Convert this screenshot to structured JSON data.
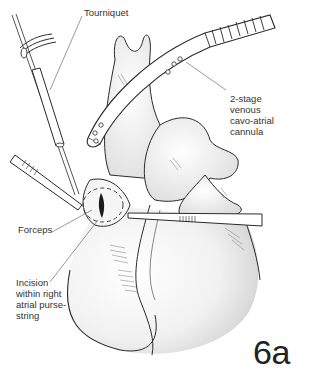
{
  "figure": {
    "number": "6a",
    "labels": {
      "tourniquet": "Tourniquet",
      "cannula": "2-stage\nvenous\ncavo-atrial\ncannula",
      "forceps": "Forceps",
      "incision": "Incision\nwithin right\natrial purse-\nstring"
    }
  },
  "colors": {
    "line": "#2a2a2a",
    "shade": "#cfcfcf",
    "label_text": "#333333",
    "leader": "#555555"
  }
}
